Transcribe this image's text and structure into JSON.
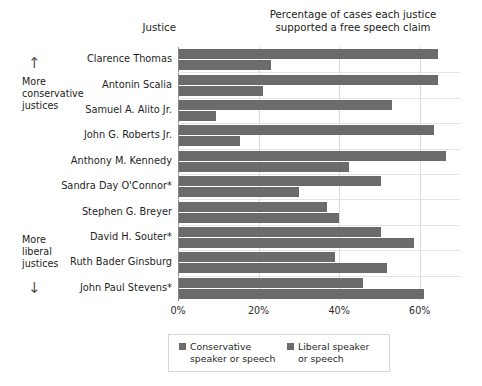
{
  "chart_data": {
    "type": "bar",
    "orientation": "horizontal",
    "title": "Percentage of cases each justice\nsupported a free speech claim",
    "column_header": "Justice",
    "xlabel": "",
    "ylabel": "",
    "xlim": [
      0,
      70
    ],
    "xticks": [
      0,
      20,
      40,
      60
    ],
    "xtick_labels": [
      "0%",
      "20%",
      "40%",
      "60%"
    ],
    "grid": true,
    "legend_position": "bottom",
    "categories": [
      "Clarence Thomas",
      "Antonin Scalia",
      "Samuel A. Alito Jr.",
      "John G. Roberts Jr.",
      "Anthony M. Kennedy",
      "Sandra Day O'Connor*",
      "Stephen G. Breyer",
      "David H. Souter*",
      "Ruth Bader Ginsburg",
      "John Paul Stevens*"
    ],
    "series": [
      {
        "name": "Conservative speaker or speech",
        "color": "#6b6b6b",
        "values": [
          64.5,
          64.5,
          53.0,
          63.5,
          66.5,
          50.5,
          37.0,
          50.5,
          39.0,
          46.0
        ]
      },
      {
        "name": "Liberal speaker or speech",
        "color": "#6b6b6b",
        "values": [
          23.0,
          21.0,
          9.5,
          15.5,
          42.5,
          30.0,
          40.0,
          58.5,
          52.0,
          61.0
        ]
      }
    ],
    "annotations": {
      "top": "More\nconservative\njustices",
      "bottom": "More\nliberal\njustices",
      "arrow_up": "↑",
      "arrow_down": "↓"
    },
    "legend": [
      {
        "line1": "Conservative",
        "line2": "speaker or speech"
      },
      {
        "line1": "Liberal speaker",
        "line2": "or speech"
      }
    ]
  }
}
